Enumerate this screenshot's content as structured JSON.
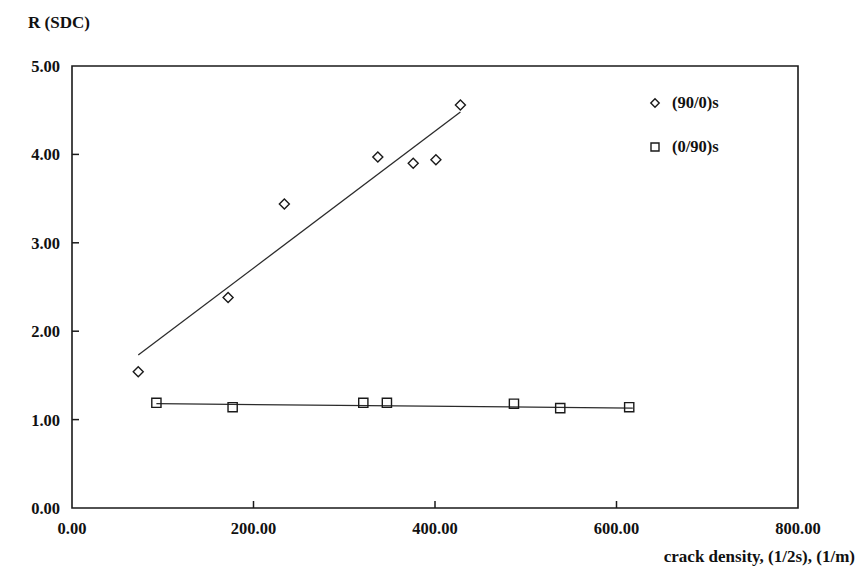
{
  "chart_data": {
    "type": "scatter",
    "title": "",
    "xlabel": "crack density, (1/2s), (1/m)",
    "ylabel": "R (SDC)",
    "xlim": [
      0,
      800
    ],
    "ylim": [
      0,
      5
    ],
    "xticks": [
      "0.00",
      "200.00",
      "400.00",
      "600.00",
      "800.00"
    ],
    "xtick_values": [
      0,
      200,
      400,
      600,
      800
    ],
    "yticks": [
      "0.00",
      "1.00",
      "2.00",
      "3.00",
      "4.00",
      "5.00"
    ],
    "ytick_values": [
      0,
      1,
      2,
      3,
      4,
      5
    ],
    "grid": false,
    "legend_position": "top-right",
    "series": [
      {
        "name": "(90/0)s",
        "marker": "diamond",
        "x": [
          73,
          172,
          234,
          337,
          376,
          401,
          428
        ],
        "y": [
          1.54,
          2.38,
          3.44,
          3.97,
          3.9,
          3.94,
          4.56
        ],
        "trendline": {
          "x0": 73,
          "y0": 1.73,
          "x1": 428,
          "y1": 4.48
        }
      },
      {
        "name": "(0/90)s",
        "marker": "square",
        "x": [
          93,
          177,
          321,
          347,
          487,
          538,
          614
        ],
        "y": [
          1.19,
          1.14,
          1.19,
          1.19,
          1.18,
          1.13,
          1.14
        ],
        "trendline": {
          "x0": 93,
          "y0": 1.18,
          "x1": 618,
          "y1": 1.13
        }
      }
    ]
  },
  "axes": {
    "ylabel_text": "R (SDC)",
    "xlabel_text": "crack density, (1/2s), (1/m)"
  },
  "legend": {
    "entries": [
      {
        "label": "(90/0)s",
        "marker": "diamond"
      },
      {
        "label": "(0/90)s",
        "marker": "square"
      }
    ]
  }
}
